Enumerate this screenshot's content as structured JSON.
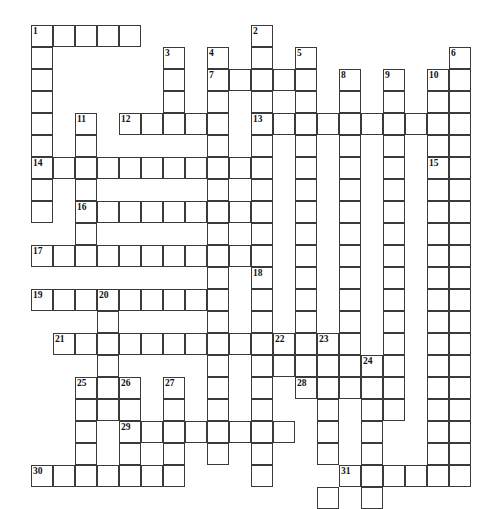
{
  "puzzle": {
    "type": "crossword-grid",
    "title": "",
    "grid": {
      "origin_x": 31,
      "origin_y": 25,
      "cell_size": 22,
      "columns": 21,
      "rows": 22,
      "cell_fill": "#ffffff",
      "cell_border": "#3a3a3a",
      "background": "#ffffff"
    },
    "numbers": [
      {
        "label": "1",
        "col": 0,
        "row": 0
      },
      {
        "label": "2",
        "col": 10,
        "row": 0
      },
      {
        "label": "3",
        "col": 6,
        "row": 1
      },
      {
        "label": "4",
        "col": 8,
        "row": 1
      },
      {
        "label": "5",
        "col": 12,
        "row": 1
      },
      {
        "label": "6",
        "col": 19,
        "row": 1
      },
      {
        "label": "7",
        "col": 8,
        "row": 2
      },
      {
        "label": "8",
        "col": 14,
        "row": 2
      },
      {
        "label": "9",
        "col": 16,
        "row": 2
      },
      {
        "label": "10",
        "col": 18,
        "row": 2
      },
      {
        "label": "11",
        "col": 2,
        "row": 4
      },
      {
        "label": "12",
        "col": 4,
        "row": 4
      },
      {
        "label": "13",
        "col": 10,
        "row": 4
      },
      {
        "label": "14",
        "col": 0,
        "row": 6
      },
      {
        "label": "15",
        "col": 18,
        "row": 6
      },
      {
        "label": "16",
        "col": 2,
        "row": 8
      },
      {
        "label": "17",
        "col": 0,
        "row": 10
      },
      {
        "label": "18",
        "col": 10,
        "row": 11
      },
      {
        "label": "19",
        "col": 0,
        "row": 12
      },
      {
        "label": "20",
        "col": 3,
        "row": 12
      },
      {
        "label": "21",
        "col": 1,
        "row": 14
      },
      {
        "label": "22",
        "col": 11,
        "row": 14
      },
      {
        "label": "23",
        "col": 13,
        "row": 14
      },
      {
        "label": "24",
        "col": 15,
        "row": 15
      },
      {
        "label": "25",
        "col": 2,
        "row": 16
      },
      {
        "label": "26",
        "col": 4,
        "row": 16
      },
      {
        "label": "27",
        "col": 6,
        "row": 16
      },
      {
        "label": "28",
        "col": 12,
        "row": 16
      },
      {
        "label": "29",
        "col": 4,
        "row": 18
      },
      {
        "label": "30",
        "col": 0,
        "row": 20
      },
      {
        "label": "31",
        "col": 14,
        "row": 20
      }
    ],
    "entries": [
      {
        "number": "1",
        "direction": "across",
        "col": 0,
        "row": 0,
        "length": 5
      },
      {
        "number": "1",
        "direction": "down",
        "col": 0,
        "row": 0,
        "length": 9
      },
      {
        "number": "2",
        "direction": "down",
        "col": 10,
        "row": 0,
        "length": 19
      },
      {
        "number": "3",
        "direction": "down",
        "col": 6,
        "row": 1,
        "length": 4
      },
      {
        "number": "4",
        "direction": "down",
        "col": 8,
        "row": 1,
        "length": 20
      },
      {
        "number": "5",
        "direction": "down",
        "col": 12,
        "row": 1,
        "length": 11
      },
      {
        "number": "6",
        "direction": "down",
        "col": 19,
        "row": 1,
        "length": 20
      },
      {
        "number": "7",
        "direction": "across",
        "col": 8,
        "row": 2,
        "length": 5
      },
      {
        "number": "8",
        "direction": "down",
        "col": 14,
        "row": 2,
        "length": 15
      },
      {
        "number": "9",
        "direction": "down",
        "col": 16,
        "row": 2,
        "length": 13
      },
      {
        "number": "10",
        "direction": "down",
        "col": 18,
        "row": 2,
        "length": 17
      },
      {
        "number": "11",
        "direction": "down",
        "col": 2,
        "row": 4,
        "length": 7
      },
      {
        "number": "12",
        "direction": "across",
        "col": 4,
        "row": 4,
        "length": 5
      },
      {
        "number": "13",
        "direction": "across",
        "col": 10,
        "row": 4,
        "length": 10
      },
      {
        "number": "14",
        "direction": "across",
        "col": 0,
        "row": 6,
        "length": 10
      },
      {
        "number": "15",
        "direction": "across",
        "col": 18,
        "row": 6,
        "length": 2
      },
      {
        "number": "16",
        "direction": "across",
        "col": 2,
        "row": 8,
        "length": 8
      },
      {
        "number": "17",
        "direction": "across",
        "col": 0,
        "row": 10,
        "length": 11
      },
      {
        "number": "18",
        "direction": "down",
        "col": 10,
        "row": 11,
        "length": 10
      },
      {
        "number": "19",
        "direction": "across",
        "col": 0,
        "row": 12,
        "length": 9
      },
      {
        "number": "20",
        "direction": "down",
        "col": 3,
        "row": 12,
        "length": 9
      },
      {
        "number": "21",
        "direction": "across",
        "col": 1,
        "row": 14,
        "length": 9
      },
      {
        "number": "22",
        "direction": "across",
        "col": 11,
        "row": 14,
        "length": 4
      },
      {
        "number": "23",
        "direction": "down",
        "col": 13,
        "row": 14,
        "length": 8
      },
      {
        "number": "24",
        "direction": "down",
        "col": 15,
        "row": 15,
        "length": 3
      },
      {
        "number": "25",
        "direction": "down",
        "col": 2,
        "row": 16,
        "length": 6
      },
      {
        "number": "26",
        "direction": "down",
        "col": 4,
        "row": 16,
        "length": 6
      },
      {
        "number": "27",
        "direction": "down",
        "col": 6,
        "row": 16,
        "length": 3
      },
      {
        "number": "28",
        "direction": "across",
        "col": 12,
        "row": 16,
        "length": 5
      },
      {
        "number": "29",
        "direction": "across",
        "col": 4,
        "row": 18,
        "length": 8
      },
      {
        "number": "30",
        "direction": "across",
        "col": 0,
        "row": 20,
        "length": 7
      },
      {
        "number": "31",
        "direction": "across",
        "col": 14,
        "row": 20,
        "length": 6
      }
    ],
    "cells": [
      [
        0,
        0
      ],
      [
        1,
        0
      ],
      [
        2,
        0
      ],
      [
        3,
        0
      ],
      [
        4,
        0
      ],
      [
        10,
        0
      ],
      [
        0,
        1
      ],
      [
        6,
        1
      ],
      [
        8,
        1
      ],
      [
        10,
        1
      ],
      [
        12,
        1
      ],
      [
        19,
        1
      ],
      [
        0,
        2
      ],
      [
        6,
        2
      ],
      [
        8,
        2
      ],
      [
        9,
        2
      ],
      [
        10,
        2
      ],
      [
        11,
        2
      ],
      [
        12,
        2
      ],
      [
        14,
        2
      ],
      [
        16,
        2
      ],
      [
        18,
        2
      ],
      [
        19,
        2
      ],
      [
        0,
        3
      ],
      [
        6,
        3
      ],
      [
        8,
        3
      ],
      [
        10,
        3
      ],
      [
        12,
        3
      ],
      [
        14,
        3
      ],
      [
        16,
        3
      ],
      [
        18,
        3
      ],
      [
        19,
        3
      ],
      [
        0,
        4
      ],
      [
        2,
        4
      ],
      [
        4,
        4
      ],
      [
        5,
        4
      ],
      [
        6,
        4
      ],
      [
        7,
        4
      ],
      [
        8,
        4
      ],
      [
        10,
        4
      ],
      [
        11,
        4
      ],
      [
        12,
        4
      ],
      [
        13,
        4
      ],
      [
        14,
        4
      ],
      [
        15,
        4
      ],
      [
        16,
        4
      ],
      [
        17,
        4
      ],
      [
        18,
        4
      ],
      [
        19,
        4
      ],
      [
        0,
        5
      ],
      [
        2,
        5
      ],
      [
        8,
        5
      ],
      [
        10,
        5
      ],
      [
        12,
        5
      ],
      [
        14,
        5
      ],
      [
        16,
        5
      ],
      [
        18,
        5
      ],
      [
        19,
        5
      ],
      [
        0,
        6
      ],
      [
        1,
        6
      ],
      [
        2,
        6
      ],
      [
        3,
        6
      ],
      [
        4,
        6
      ],
      [
        5,
        6
      ],
      [
        6,
        6
      ],
      [
        7,
        6
      ],
      [
        8,
        6
      ],
      [
        9,
        6
      ],
      [
        10,
        6
      ],
      [
        12,
        6
      ],
      [
        14,
        6
      ],
      [
        16,
        6
      ],
      [
        18,
        6
      ],
      [
        19,
        6
      ],
      [
        0,
        7
      ],
      [
        2,
        7
      ],
      [
        8,
        7
      ],
      [
        10,
        7
      ],
      [
        12,
        7
      ],
      [
        14,
        7
      ],
      [
        16,
        7
      ],
      [
        18,
        7
      ],
      [
        19,
        7
      ],
      [
        0,
        8
      ],
      [
        2,
        8
      ],
      [
        3,
        8
      ],
      [
        4,
        8
      ],
      [
        5,
        8
      ],
      [
        6,
        8
      ],
      [
        7,
        8
      ],
      [
        8,
        8
      ],
      [
        9,
        8
      ],
      [
        10,
        8
      ],
      [
        12,
        8
      ],
      [
        14,
        8
      ],
      [
        16,
        8
      ],
      [
        18,
        8
      ],
      [
        19,
        8
      ],
      [
        2,
        9
      ],
      [
        8,
        9
      ],
      [
        10,
        9
      ],
      [
        12,
        9
      ],
      [
        14,
        9
      ],
      [
        16,
        9
      ],
      [
        18,
        9
      ],
      [
        19,
        9
      ],
      [
        0,
        10
      ],
      [
        1,
        10
      ],
      [
        2,
        10
      ],
      [
        3,
        10
      ],
      [
        4,
        10
      ],
      [
        5,
        10
      ],
      [
        6,
        10
      ],
      [
        7,
        10
      ],
      [
        8,
        10
      ],
      [
        9,
        10
      ],
      [
        10,
        10
      ],
      [
        12,
        10
      ],
      [
        14,
        10
      ],
      [
        16,
        10
      ],
      [
        18,
        10
      ],
      [
        19,
        10
      ],
      [
        8,
        11
      ],
      [
        10,
        11
      ],
      [
        12,
        11
      ],
      [
        14,
        11
      ],
      [
        16,
        11
      ],
      [
        18,
        11
      ],
      [
        19,
        11
      ],
      [
        0,
        12
      ],
      [
        1,
        12
      ],
      [
        2,
        12
      ],
      [
        3,
        12
      ],
      [
        4,
        12
      ],
      [
        5,
        12
      ],
      [
        6,
        12
      ],
      [
        7,
        12
      ],
      [
        8,
        12
      ],
      [
        10,
        12
      ],
      [
        12,
        12
      ],
      [
        14,
        12
      ],
      [
        16,
        12
      ],
      [
        18,
        12
      ],
      [
        19,
        12
      ],
      [
        3,
        13
      ],
      [
        8,
        13
      ],
      [
        10,
        13
      ],
      [
        12,
        13
      ],
      [
        14,
        13
      ],
      [
        16,
        13
      ],
      [
        18,
        13
      ],
      [
        19,
        13
      ],
      [
        1,
        14
      ],
      [
        2,
        14
      ],
      [
        3,
        14
      ],
      [
        4,
        14
      ],
      [
        5,
        14
      ],
      [
        6,
        14
      ],
      [
        7,
        14
      ],
      [
        8,
        14
      ],
      [
        9,
        14
      ],
      [
        10,
        14
      ],
      [
        11,
        14
      ],
      [
        12,
        14
      ],
      [
        13,
        14
      ],
      [
        14,
        14
      ],
      [
        16,
        14
      ],
      [
        18,
        14
      ],
      [
        19,
        14
      ],
      [
        3,
        15
      ],
      [
        8,
        15
      ],
      [
        10,
        15
      ],
      [
        11,
        15
      ],
      [
        12,
        15
      ],
      [
        13,
        15
      ],
      [
        14,
        15
      ],
      [
        15,
        15
      ],
      [
        16,
        15
      ],
      [
        18,
        15
      ],
      [
        19,
        15
      ],
      [
        2,
        16
      ],
      [
        3,
        16
      ],
      [
        4,
        16
      ],
      [
        6,
        16
      ],
      [
        8,
        16
      ],
      [
        10,
        16
      ],
      [
        12,
        16
      ],
      [
        13,
        16
      ],
      [
        14,
        16
      ],
      [
        15,
        16
      ],
      [
        16,
        16
      ],
      [
        18,
        16
      ],
      [
        19,
        16
      ],
      [
        2,
        17
      ],
      [
        3,
        17
      ],
      [
        4,
        17
      ],
      [
        6,
        17
      ],
      [
        8,
        17
      ],
      [
        10,
        17
      ],
      [
        13,
        17
      ],
      [
        15,
        17
      ],
      [
        16,
        17
      ],
      [
        18,
        17
      ],
      [
        19,
        17
      ],
      [
        2,
        18
      ],
      [
        4,
        18
      ],
      [
        5,
        18
      ],
      [
        6,
        18
      ],
      [
        7,
        18
      ],
      [
        8,
        18
      ],
      [
        9,
        18
      ],
      [
        10,
        18
      ],
      [
        11,
        18
      ],
      [
        13,
        18
      ],
      [
        15,
        18
      ],
      [
        18,
        18
      ],
      [
        19,
        18
      ],
      [
        2,
        19
      ],
      [
        4,
        19
      ],
      [
        6,
        19
      ],
      [
        8,
        19
      ],
      [
        10,
        19
      ],
      [
        13,
        19
      ],
      [
        15,
        19
      ],
      [
        18,
        19
      ],
      [
        19,
        19
      ],
      [
        0,
        20
      ],
      [
        1,
        20
      ],
      [
        2,
        20
      ],
      [
        3,
        20
      ],
      [
        4,
        20
      ],
      [
        5,
        20
      ],
      [
        6,
        20
      ],
      [
        10,
        20
      ],
      [
        14,
        20
      ],
      [
        15,
        20
      ],
      [
        16,
        20
      ],
      [
        17,
        20
      ],
      [
        18,
        20
      ],
      [
        19,
        20
      ],
      [
        13,
        21
      ],
      [
        15,
        21
      ]
    ]
  }
}
